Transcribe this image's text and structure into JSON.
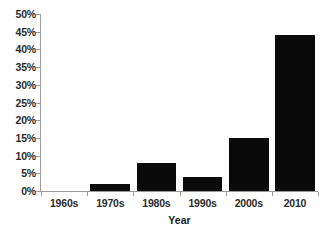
{
  "chart_data": {
    "type": "bar",
    "title": "",
    "subtitle": "",
    "categories": [
      "1960s",
      "1970s",
      "1980s",
      "1990s",
      "2000s",
      "2010"
    ],
    "values": [
      0,
      2,
      8,
      4,
      15,
      44
    ],
    "value_labels": [
      "0%",
      "2%",
      "8%",
      "4%",
      "15%",
      "44%"
    ],
    "xlabel": "Year",
    "ylabel": "",
    "ylim": [
      0,
      50
    ],
    "ytick_step": 5,
    "ytick_labels": [
      "50%",
      "45%",
      "40%",
      "35%",
      "30%",
      "25%",
      "20%",
      "15%",
      "10%",
      "5%",
      "0%"
    ],
    "ytick_values": [
      50,
      45,
      40,
      35,
      30,
      25,
      20,
      15,
      10,
      5,
      0
    ],
    "grid": false,
    "legend": false,
    "legend_position": "none",
    "series": [
      {
        "name": "",
        "values": [
          0,
          2,
          8,
          4,
          15,
          44
        ]
      }
    ],
    "colors": {
      "bar": "#0a0a0a",
      "axis": "#9a9a9a",
      "text": "#2b2b2b",
      "background": "#ffffff"
    }
  }
}
